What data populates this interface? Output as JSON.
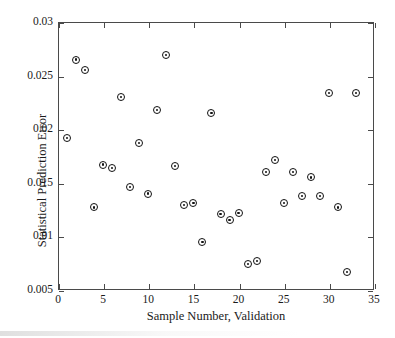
{
  "figure": {
    "background_color": "#ffffff",
    "axis_color": "#4a4a4a",
    "marker_color": "#111111",
    "marker_face_color": "#ffffff"
  },
  "chart_data": {
    "type": "scatter",
    "title": "",
    "xlabel": "Sample Number, Validation",
    "ylabel": "Statistical Prediction Error",
    "xlim": [
      0,
      35
    ],
    "ylim": [
      0.005,
      0.03
    ],
    "xticks": [
      0,
      5,
      10,
      15,
      20,
      25,
      30,
      35
    ],
    "xtick_labels": [
      "0",
      "5",
      "10",
      "15",
      "20",
      "25",
      "30",
      "35"
    ],
    "yticks": [
      0.005,
      0.01,
      0.015,
      0.02,
      0.025,
      0.03
    ],
    "ytick_labels": [
      "0.005",
      "0.01",
      "0.015",
      "0.02",
      "0.025",
      "0.03"
    ],
    "grid": false,
    "legend": null,
    "marker": "circle-open",
    "series": [
      {
        "name": "Validation samples",
        "x": [
          1,
          2,
          3,
          4,
          5,
          6,
          7,
          8,
          9,
          10,
          11,
          12,
          13,
          14,
          15,
          16,
          17,
          18,
          19,
          20,
          21,
          22,
          23,
          24,
          25,
          26,
          27,
          28,
          29,
          30,
          31,
          32,
          33
        ],
        "y": [
          0.0192,
          0.0265,
          0.0255,
          0.0127,
          0.0167,
          0.0164,
          0.023,
          0.0146,
          0.0187,
          0.014,
          0.0218,
          0.0269,
          0.0166,
          0.0129,
          0.0131,
          0.0095,
          0.0215,
          0.0121,
          0.0115,
          0.0122,
          0.0074,
          0.0077,
          0.016,
          0.0171,
          0.0131,
          0.016,
          0.0138,
          0.0155,
          0.0138,
          0.0234,
          0.0127,
          0.0067,
          0.0234
        ]
      }
    ],
    "n_points": 33
  }
}
